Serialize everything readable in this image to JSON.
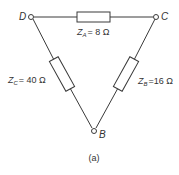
{
  "diagram": {
    "type": "delta-impedance-network",
    "caption": "(a)",
    "nodes": [
      {
        "id": "D",
        "label": "D"
      },
      {
        "id": "C",
        "label": "C"
      },
      {
        "id": "B",
        "label": "B"
      }
    ],
    "impedances": [
      {
        "id": "ZA",
        "symbol": "Z",
        "subscript": "A",
        "value": "= 8 Ω",
        "between": [
          "D",
          "C"
        ]
      },
      {
        "id": "ZB",
        "symbol": "Z",
        "subscript": "B",
        "value": "=16 Ω",
        "between": [
          "C",
          "B"
        ]
      },
      {
        "id": "ZC",
        "symbol": "Z",
        "subscript": "C",
        "value": "= 40 Ω",
        "between": [
          "D",
          "B"
        ]
      }
    ]
  }
}
